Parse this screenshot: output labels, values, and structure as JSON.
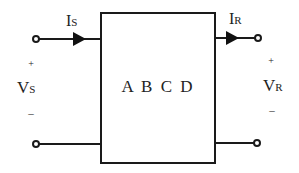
{
  "diagram": {
    "type": "two-port network",
    "block_label": "A B C D",
    "input": {
      "current_main": "I",
      "current_sub": "S",
      "voltage_main": "V",
      "voltage_sub": "S",
      "plus": "+",
      "minus": "–"
    },
    "output": {
      "current_main": "I",
      "current_sub": "R",
      "voltage_main": "V",
      "voltage_sub": "R",
      "plus": "+",
      "minus": "–"
    },
    "colors": {
      "line": "#1a1a1a",
      "text": "#222222",
      "background": "#ffffff"
    }
  }
}
